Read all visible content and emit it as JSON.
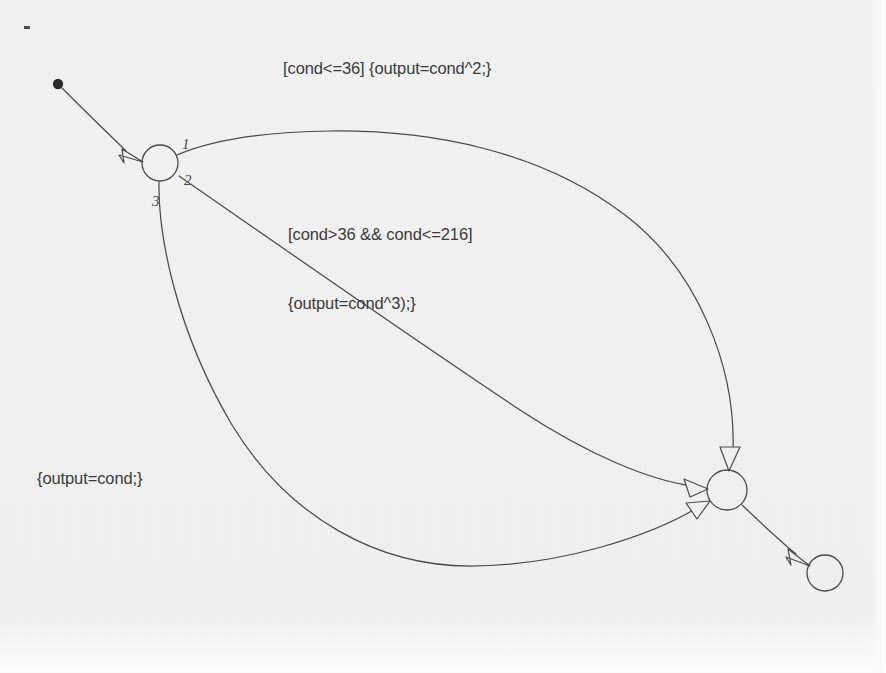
{
  "diagram": {
    "kind": "state-machine-transition-diagram",
    "background_color": "#f0f0f0",
    "stroke_color": "#4a4a4a",
    "text_color": "#3b3b3b",
    "canvas": {
      "width": 886,
      "height": 673
    },
    "nodes": [
      {
        "id": "start",
        "name": "initial-pseudostate",
        "shape": "filled-dot",
        "cx": 58,
        "cy": 84,
        "r": 5,
        "label": ""
      },
      {
        "id": "source",
        "name": "source-state",
        "shape": "circle",
        "cx": 160,
        "cy": 163,
        "r": 18,
        "label": ""
      },
      {
        "id": "target",
        "name": "target-state",
        "shape": "circle",
        "cx": 727,
        "cy": 490,
        "r": 20,
        "label": ""
      },
      {
        "id": "final",
        "name": "final-state",
        "shape": "circle",
        "cx": 825,
        "cy": 573,
        "r": 18,
        "label": ""
      }
    ],
    "ports": [
      {
        "id": "p1",
        "name": "branch-port-1",
        "text": "1",
        "x": 182,
        "y": 141
      },
      {
        "id": "p2",
        "name": "branch-port-2",
        "text": "2",
        "x": 184,
        "y": 176
      },
      {
        "id": "p3",
        "name": "branch-port-3",
        "text": "3",
        "x": 152,
        "y": 196
      }
    ],
    "edges": [
      {
        "id": "e-start",
        "name": "initial-transition",
        "from": "start",
        "to": "source",
        "label": "",
        "arrowhead": "hollow-triangle"
      },
      {
        "id": "e1",
        "name": "transition-branch-1",
        "from": "source",
        "to": "target",
        "port": "1",
        "label": "[cond<=36] {output=cond^2;}",
        "arrowhead": "hollow-triangle"
      },
      {
        "id": "e2",
        "name": "transition-branch-2",
        "from": "source",
        "to": "target",
        "port": "2",
        "label": "[cond>36 && cond<=216]\n{output=cond^3);}",
        "arrowhead": "hollow-triangle"
      },
      {
        "id": "e3",
        "name": "transition-branch-3",
        "from": "source",
        "to": "target",
        "port": "3",
        "label": "{output=cond;}",
        "arrowhead": "hollow-triangle"
      },
      {
        "id": "e-final",
        "name": "final-transition",
        "from": "target",
        "to": "final",
        "label": "",
        "arrowhead": "hollow-triangle"
      }
    ],
    "labels": [
      {
        "id": "lbl1",
        "name": "guard-action-label-1",
        "lines": [
          "[cond<=36] {output=cond^2;}"
        ],
        "x": 283,
        "y": 57
      },
      {
        "id": "lbl2",
        "name": "guard-action-label-2",
        "lines": [
          "[cond>36 && cond<=216]",
          "{output=cond^3);}"
        ],
        "x": 288,
        "y": 177
      },
      {
        "id": "lbl3",
        "name": "action-label-3",
        "lines": [
          "{output=cond;}"
        ],
        "x": 37,
        "y": 467
      }
    ],
    "artifacts": [
      {
        "id": "speck1",
        "name": "scan-speck",
        "x": 24,
        "y": 26,
        "w": 6,
        "h": 3
      }
    ]
  }
}
